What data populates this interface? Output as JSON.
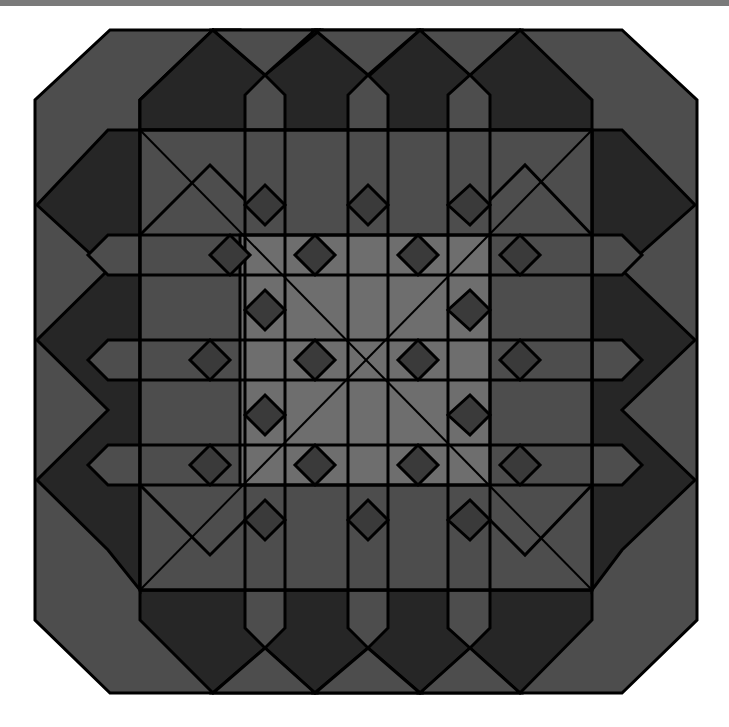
{
  "image": {
    "description": "Geometric woven octagonal tile pattern",
    "colors": {
      "background": "#ffffff",
      "top_bar": "#7a7a7a",
      "mid_gray": "#4d4d4d",
      "dark_gray": "#262626",
      "light_gray": "#6e6e6e",
      "highlight": "#ffffff",
      "stroke": "#000000"
    }
  }
}
